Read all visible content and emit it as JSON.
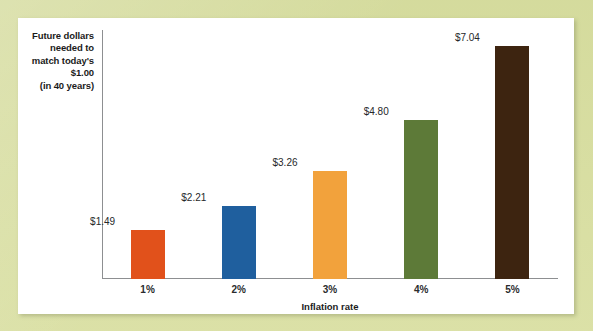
{
  "page": {
    "background_color": "#d9dfa2",
    "panel_color": "#ffffff"
  },
  "chart_data": {
    "type": "bar",
    "title": "",
    "subtitle": "",
    "xlabel": "Inflation rate",
    "ylabel": "Future dollars needed to match today's $1.00 (in 40 years)",
    "ylabel_lines": [
      "Future dollars",
      "needed to",
      "match today's",
      "$1.00",
      "(in 40 years)"
    ],
    "categories": [
      "1%",
      "2%",
      "3%",
      "4%",
      "5%"
    ],
    "values": [
      1.49,
      2.21,
      3.26,
      4.8,
      7.04
    ],
    "value_labels": [
      "$1.49",
      "$2.21",
      "$3.26",
      "$4.80",
      "$7.04"
    ],
    "bar_colors": [
      "#e1511b",
      "#1f5f9e",
      "#f2a23c",
      "#5d7a38",
      "#3d2410"
    ],
    "ylim": [
      0,
      7.9
    ],
    "grid": false,
    "legend": false,
    "axis_color": "#8d8f91"
  },
  "bars": [
    {
      "category": "1%",
      "value": 1.49,
      "label": "$1.49",
      "color": "#e1511b"
    },
    {
      "category": "2%",
      "value": 2.21,
      "label": "$2.21",
      "color": "#1f5f9e"
    },
    {
      "category": "3%",
      "value": 3.26,
      "label": "$3.26",
      "color": "#f2a23c"
    },
    {
      "category": "4%",
      "value": 4.8,
      "label": "$4.80",
      "color": "#5d7a38"
    },
    {
      "category": "5%",
      "value": 7.04,
      "label": "$7.04",
      "color": "#3d2410"
    }
  ]
}
